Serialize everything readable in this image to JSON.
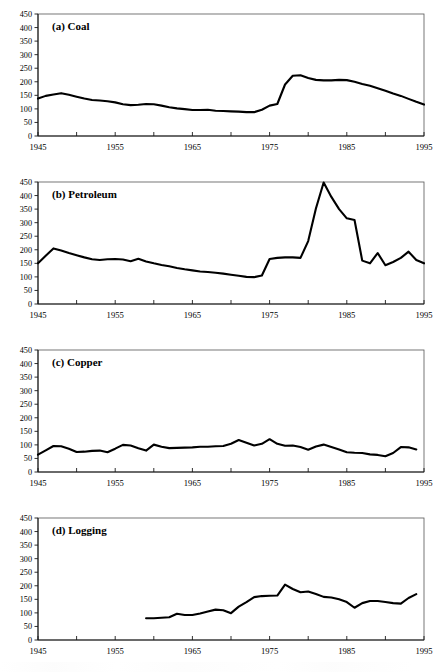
{
  "figure": {
    "width": 448,
    "height": 672,
    "background": "#ffffff",
    "line_color": "#000000",
    "axis_color": "#1a1a1a",
    "frame_color": "#555555"
  },
  "chart_data": [
    {
      "type": "line",
      "title": "(a) Coal",
      "xlabel": "",
      "ylabel": "",
      "xlim": [
        1945,
        1995
      ],
      "ylim": [
        0,
        450
      ],
      "ytick_values": [
        0,
        50,
        100,
        150,
        200,
        250,
        300,
        350,
        400,
        450
      ],
      "ytick_labels": [
        "0",
        "50",
        "100",
        "150",
        "200",
        "250",
        "300",
        "350",
        "400",
        "450"
      ],
      "xtick_values": [
        1945,
        1950,
        1955,
        1960,
        1965,
        1970,
        1975,
        1980,
        1985,
        1990,
        1995
      ],
      "xtick_labels": [
        "1945",
        "",
        "1955",
        "",
        "1965",
        "",
        "1975",
        "",
        "1985",
        "",
        "1995"
      ],
      "grid": false,
      "legend": "none",
      "series": [
        {
          "name": "Coal",
          "x": [
            1945,
            1946,
            1947,
            1948,
            1949,
            1950,
            1951,
            1952,
            1953,
            1954,
            1955,
            1956,
            1957,
            1958,
            1959,
            1960,
            1961,
            1962,
            1963,
            1964,
            1965,
            1966,
            1967,
            1968,
            1969,
            1970,
            1971,
            1972,
            1973,
            1974,
            1975,
            1976,
            1977,
            1978,
            1979,
            1980,
            1981,
            1982,
            1983,
            1984,
            1985,
            1986,
            1987,
            1988,
            1989,
            1990,
            1991,
            1992,
            1993,
            1994,
            1995
          ],
          "values": [
            138,
            148,
            153,
            158,
            152,
            145,
            138,
            133,
            131,
            128,
            124,
            117,
            114,
            115,
            118,
            117,
            112,
            106,
            102,
            99,
            96,
            96,
            97,
            93,
            92,
            91,
            90,
            88,
            88,
            97,
            112,
            118,
            190,
            222,
            224,
            214,
            207,
            205,
            205,
            207,
            206,
            200,
            192,
            185,
            176,
            167,
            157,
            148,
            137,
            126,
            116,
            105,
            97,
            88
          ]
        }
      ]
    },
    {
      "type": "line",
      "title": "(b) Petroleum",
      "xlabel": "",
      "ylabel": "",
      "xlim": [
        1945,
        1995
      ],
      "ylim": [
        0,
        450
      ],
      "ytick_values": [
        0,
        50,
        100,
        150,
        200,
        250,
        300,
        350,
        400,
        450
      ],
      "ytick_labels": [
        "0",
        "50",
        "100",
        "150",
        "200",
        "250",
        "300",
        "350",
        "400",
        "450"
      ],
      "xtick_values": [
        1945,
        1950,
        1955,
        1960,
        1965,
        1970,
        1975,
        1980,
        1985,
        1990,
        1995
      ],
      "xtick_labels": [
        "1945",
        "",
        "1955",
        "",
        "1965",
        "",
        "1975",
        "",
        "1985",
        "",
        "1995"
      ],
      "grid": false,
      "legend": "none",
      "series": [
        {
          "name": "Petroleum",
          "x": [
            1945,
            1946,
            1947,
            1948,
            1949,
            1950,
            1951,
            1952,
            1953,
            1954,
            1955,
            1956,
            1957,
            1958,
            1959,
            1960,
            1961,
            1962,
            1963,
            1964,
            1965,
            1966,
            1967,
            1968,
            1969,
            1970,
            1971,
            1972,
            1973,
            1974,
            1975,
            1976,
            1977,
            1978,
            1979,
            1980,
            1981,
            1982,
            1983,
            1984,
            1985,
            1986,
            1987,
            1988,
            1989,
            1990,
            1991,
            1992,
            1993,
            1994,
            1995
          ],
          "values": [
            150,
            178,
            205,
            197,
            188,
            180,
            172,
            165,
            162,
            165,
            166,
            164,
            158,
            167,
            157,
            150,
            144,
            139,
            133,
            128,
            124,
            120,
            118,
            115,
            112,
            108,
            104,
            100,
            99,
            105,
            166,
            170,
            172,
            172,
            170,
            232,
            352,
            448,
            395,
            350,
            316,
            310,
            160,
            150,
            188,
            143,
            155,
            170,
            193,
            162,
            150,
            138,
            110,
            122
          ]
        }
      ]
    },
    {
      "type": "line",
      "title": "(c) Copper",
      "xlabel": "",
      "ylabel": "",
      "xlim": [
        1945,
        1995
      ],
      "ylim": [
        0,
        450
      ],
      "ytick_values": [
        0,
        50,
        100,
        150,
        200,
        250,
        300,
        350,
        400,
        450
      ],
      "ytick_labels": [
        "0",
        "50",
        "100",
        "150",
        "200",
        "250",
        "300",
        "350",
        "400",
        "450"
      ],
      "xtick_values": [
        1945,
        1950,
        1955,
        1960,
        1965,
        1970,
        1975,
        1980,
        1985,
        1990,
        1995
      ],
      "xtick_labels": [
        "1945",
        "",
        "1955",
        "",
        "1965",
        "",
        "1975",
        "",
        "1985",
        "",
        "1995"
      ],
      "grid": false,
      "legend": "none",
      "series": [
        {
          "name": "Copper",
          "x": [
            1945,
            1946,
            1947,
            1948,
            1949,
            1950,
            1951,
            1952,
            1953,
            1954,
            1955,
            1956,
            1957,
            1958,
            1959,
            1960,
            1961,
            1962,
            1963,
            1964,
            1965,
            1966,
            1967,
            1968,
            1969,
            1970,
            1971,
            1972,
            1973,
            1974,
            1975,
            1976,
            1977,
            1978,
            1979,
            1980,
            1981,
            1982,
            1983,
            1984,
            1985,
            1986,
            1987,
            1988,
            1989,
            1990,
            1991,
            1992,
            1993,
            1994
          ],
          "values": [
            64,
            80,
            96,
            95,
            86,
            74,
            75,
            78,
            79,
            73,
            86,
            100,
            98,
            88,
            79,
            101,
            93,
            88,
            89,
            90,
            91,
            93,
            93,
            95,
            96,
            104,
            118,
            108,
            98,
            104,
            121,
            104,
            97,
            98,
            92,
            82,
            94,
            101,
            92,
            83,
            73,
            71,
            70,
            65,
            63,
            58,
            70,
            92,
            91,
            83,
            75,
            64
          ]
        }
      ]
    },
    {
      "type": "line",
      "title": "(d) Logging",
      "xlabel": "",
      "ylabel": "",
      "xlim": [
        1945,
        1995
      ],
      "ylim": [
        0,
        450
      ],
      "ytick_values": [
        0,
        50,
        100,
        150,
        200,
        250,
        300,
        350,
        400,
        450
      ],
      "ytick_labels": [
        "0",
        "50",
        "100",
        "150",
        "200",
        "250",
        "300",
        "350",
        "400",
        "450"
      ],
      "xtick_values": [
        1945,
        1950,
        1955,
        1960,
        1965,
        1970,
        1975,
        1980,
        1985,
        1990,
        1995
      ],
      "xtick_labels": [
        "1945",
        "",
        "1955",
        "",
        "1965",
        "",
        "1975",
        "",
        "1985",
        "",
        "1995"
      ],
      "grid": false,
      "legend": "none",
      "series": [
        {
          "name": "Logging",
          "x": [
            1959,
            1960,
            1961,
            1962,
            1963,
            1964,
            1965,
            1966,
            1967,
            1968,
            1969,
            1970,
            1971,
            1972,
            1973,
            1974,
            1975,
            1976,
            1977,
            1978,
            1979,
            1980,
            1981,
            1982,
            1983,
            1984,
            1985,
            1986,
            1987,
            1988,
            1989,
            1990,
            1991,
            1992,
            1993,
            1994
          ],
          "values": [
            80,
            80,
            82,
            84,
            97,
            92,
            92,
            98,
            105,
            112,
            110,
            99,
            123,
            140,
            158,
            162,
            163,
            164,
            204,
            188,
            176,
            179,
            170,
            159,
            157,
            150,
            140,
            119,
            136,
            144,
            144,
            140,
            136,
            134,
            155,
            169
          ]
        }
      ]
    }
  ]
}
